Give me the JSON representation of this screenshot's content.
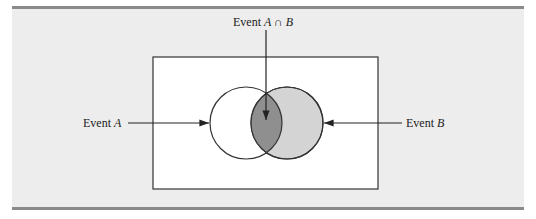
{
  "diagram": {
    "type": "venn",
    "labels": {
      "intersection_prefix": "Event ",
      "intersection_math": "A ∩ B",
      "event_a_prefix": "Event ",
      "event_a_math": "A",
      "event_b_prefix": "Event ",
      "event_b_math": "B"
    },
    "colors": {
      "background": "#ededed",
      "rule": "#8a8a8a",
      "sample_space": "#ffffff",
      "circle_b_fill": "#d4d4d4",
      "intersection_fill": "#8f8f8f",
      "stroke": "#333333"
    }
  }
}
